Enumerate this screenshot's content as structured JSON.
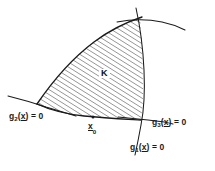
{
  "figure": {
    "background_color": "#ffffff",
    "ink_color": "#1a1a1a",
    "width": 215,
    "height": 171
  },
  "region": {
    "name": "K",
    "label": "K",
    "fill": "hatched",
    "hatch_angle_deg": 58,
    "hatch_spacing_px": 4,
    "hatch_color": "#2b2b2b"
  },
  "point": {
    "name": "x0",
    "label_base": "x",
    "label_sub": "0",
    "vector_underline": true,
    "x": 93,
    "y": 118
  },
  "constraints": [
    {
      "id": "g1",
      "name": "g1",
      "label_base": "g",
      "label_sub": "1",
      "label_arg": "x",
      "label_rhs": "= 0",
      "orientation": "near-vertical, right boundary",
      "label_x": 130,
      "label_y": 142
    },
    {
      "id": "g2",
      "name": "g2",
      "label_base": "g",
      "label_sub": "2",
      "label_arg": "x",
      "label_rhs": "= 0",
      "orientation": "shallow line through left vertex",
      "label_x": 9,
      "label_y": 111
    },
    {
      "id": "g3",
      "name": "g3",
      "label_base": "g",
      "label_sub": "3",
      "label_arg": "x",
      "label_rhs": "= 0",
      "orientation": "near-horizontal arc across top-right",
      "label_x": 152,
      "label_y": 117
    }
  ],
  "curves": {
    "boundary_top": "arc from left vertex rising to top-right apex",
    "boundary_bottom": "arc from left vertex to bottom-right corner",
    "boundary_right": "near-vertical arc from apex down to bottom-right corner"
  }
}
